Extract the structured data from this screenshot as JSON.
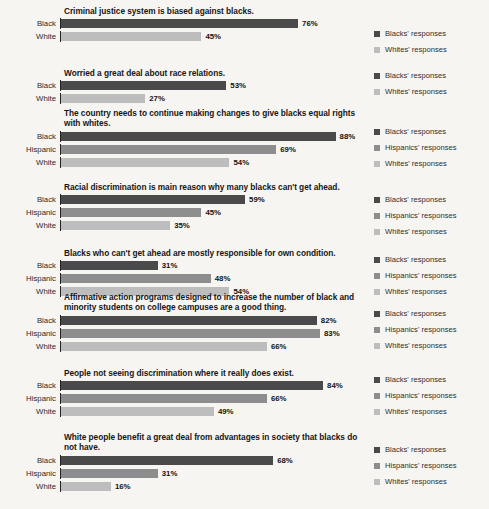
{
  "colors": {
    "background": "#f6f5f2",
    "axis": "#232323",
    "black_series": "#4a4a4a",
    "hispanic_series": "#8d8d8d",
    "white_series": "#bdbdbd",
    "text": "#1b1b1b"
  },
  "legend_labels": {
    "black": "Blacks' responses",
    "hispanic": "Hispanics' responses",
    "white": "Whites' responses"
  },
  "chart_data": {
    "type": "bar",
    "orientation": "horizontal",
    "title": "",
    "xlabel": "",
    "ylabel": "",
    "xlim": [
      0,
      100
    ],
    "grid": false,
    "value_suffix": "%",
    "legend_position": "right",
    "panels": [
      {
        "title": "Criminal justice system is biased against blacks.",
        "categories": [
          "Black",
          "White"
        ],
        "values": [
          76,
          45
        ],
        "value_labels": [
          "76%",
          "45%"
        ],
        "series": [
          "black",
          "white"
        ],
        "legend": [
          "black",
          "white"
        ]
      },
      {
        "title": "Worried a great deal about race relations.",
        "categories": [
          "Black",
          "White"
        ],
        "values": [
          53,
          27
        ],
        "value_labels": [
          "53%",
          "27%"
        ],
        "series": [
          "black",
          "white"
        ],
        "legend": [
          "black",
          "white"
        ]
      },
      {
        "title": "The country needs to continue making changes to give blacks equal rights with whites.",
        "categories": [
          "Black",
          "Hispanic",
          "White"
        ],
        "values": [
          88,
          69,
          54
        ],
        "value_labels": [
          "88%",
          "69%",
          "54%"
        ],
        "series": [
          "black",
          "hispanic",
          "white"
        ],
        "legend": [
          "black",
          "hispanic",
          "white"
        ]
      },
      {
        "title": "Racial discrimination is main reason why many blacks can't get ahead.",
        "categories": [
          "Black",
          "Hispanic",
          "White"
        ],
        "values": [
          59,
          45,
          35
        ],
        "value_labels": [
          "59%",
          "45%",
          "35%"
        ],
        "series": [
          "black",
          "hispanic",
          "white"
        ],
        "legend": [
          "black",
          "hispanic",
          "white"
        ]
      },
      {
        "title": "Blacks who can't get ahead are mostly responsible for own condition.",
        "categories": [
          "Black",
          "Hispanic",
          "White"
        ],
        "values": [
          31,
          48,
          54
        ],
        "value_labels": [
          "31%",
          "48%",
          "54%"
        ],
        "series": [
          "black",
          "hispanic",
          "white"
        ],
        "legend": [
          "black",
          "hispanic",
          "white"
        ]
      },
      {
        "title": "Affirmative action programs designed to increase the number of black and minority students on college campuses are a good thing.",
        "categories": [
          "Black",
          "Hispanic",
          "White"
        ],
        "values": [
          82,
          83,
          66
        ],
        "value_labels": [
          "82%",
          "83%",
          "66%"
        ],
        "series": [
          "black",
          "hispanic",
          "white"
        ],
        "legend": [
          "black",
          "hispanic",
          "white"
        ]
      },
      {
        "title": "People not seeing discrimination where it really does exist.",
        "categories": [
          "Black",
          "Hispanic",
          "White"
        ],
        "values": [
          84,
          66,
          49
        ],
        "value_labels": [
          "84%",
          "66%",
          "49%"
        ],
        "series": [
          "black",
          "hispanic",
          "white"
        ],
        "legend": [
          "black",
          "hispanic",
          "white"
        ]
      },
      {
        "title": "White people benefit a great deal from advantages in society that blacks do not have.",
        "categories": [
          "Black",
          "Hispanic",
          "White"
        ],
        "values": [
          68,
          31,
          16
        ],
        "value_labels": [
          "68%",
          "31%",
          "16%"
        ],
        "series": [
          "black",
          "hispanic",
          "white"
        ],
        "legend": [
          "black",
          "hispanic",
          "white"
        ]
      }
    ]
  }
}
